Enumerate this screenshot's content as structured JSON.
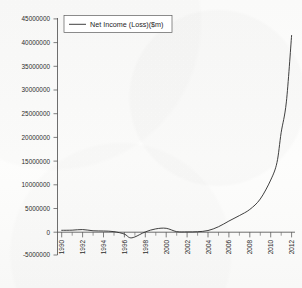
{
  "chart_data": {
    "type": "line",
    "title": "",
    "xlabel": "",
    "ylabel": "",
    "ylim": [
      -5000000,
      45000000
    ],
    "xlim": [
      1990,
      2012
    ],
    "grid": false,
    "legend_position": "top-left",
    "ytick_labels": [
      "45000000",
      "40000000",
      "35000000",
      "30000000",
      "25000000",
      "20000000",
      "15000000",
      "10000000",
      "5000000",
      "0",
      "-5000000"
    ],
    "ytick_values": [
      45000000,
      40000000,
      35000000,
      30000000,
      25000000,
      20000000,
      15000000,
      10000000,
      5000000,
      0,
      -5000000
    ],
    "xtick_labels": [
      "1990",
      "1992",
      "1994",
      "1996",
      "1998",
      "2000",
      "2002",
      "2004",
      "2006",
      "2008",
      "2010",
      "2012"
    ],
    "xtick_values": [
      1990,
      1992,
      1994,
      1996,
      1998,
      2000,
      2002,
      2004,
      2006,
      2008,
      2010,
      2012
    ],
    "xtick_minor_values": [
      1991,
      1993,
      1995,
      1997,
      1999,
      2001,
      2003,
      2005,
      2007,
      2009,
      2011
    ],
    "series": [
      {
        "name": "Net Income (Loss)($m)",
        "color": "#2a2a2a",
        "x": [
          1990,
          1991,
          1992,
          1993,
          1994,
          1995,
          1996,
          1996.5,
          1997,
          1998,
          1999,
          2000,
          2001,
          2002,
          2003,
          2004,
          2005,
          2006,
          2007,
          2008,
          2009,
          2010,
          2010.6,
          2011,
          2011.5,
          2012
        ],
        "values": [
          400000,
          430000,
          560000,
          300000,
          250000,
          120000,
          -400000,
          -1150000,
          -1000000,
          60000,
          700000,
          820000,
          120000,
          60000,
          100000,
          350000,
          1150000,
          2350000,
          3500000,
          4800000,
          7000000,
          11000000,
          14700000,
          21000000,
          27500000,
          41500000
        ]
      }
    ]
  },
  "legend": {
    "entries": [
      {
        "label": "Net Income (Loss)($m)"
      }
    ]
  }
}
